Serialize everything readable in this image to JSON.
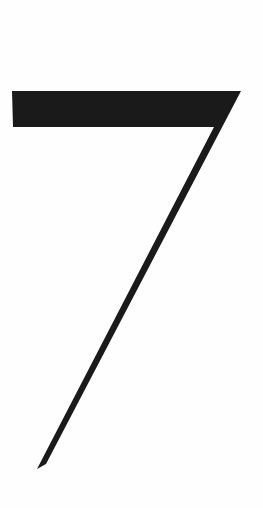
{
  "page": {
    "width": 263,
    "height": 508,
    "background_color": "#fefefe"
  },
  "glyph": {
    "character": "7",
    "description": "large black digit seven",
    "color": "#1a1a1a",
    "polygon_points": "12,91 241,91 46,464 37,469 214,127 13,127"
  }
}
